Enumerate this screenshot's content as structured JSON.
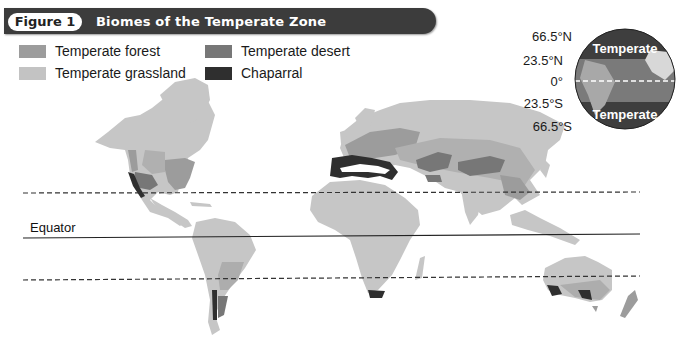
{
  "figure": {
    "number_label": "Figure 1",
    "title": "Biomes of the Temperate Zone"
  },
  "legend": [
    {
      "label": "Temperate forest",
      "color": "#9c9c9c"
    },
    {
      "label": "Temperate desert",
      "color": "#777777"
    },
    {
      "label": "Temperate grassland",
      "color": "#c3c3c3"
    },
    {
      "label": "Chaparral",
      "color": "#2f2f2f"
    }
  ],
  "globe_inset": {
    "latitude_labels": [
      "66.5°N",
      "23.5°N",
      "0°",
      "23.5°S",
      "66.5°S"
    ],
    "north_band_label": "Temperate",
    "south_band_label": "Temperate"
  },
  "map": {
    "equator_label": "Equator",
    "lines": [
      {
        "name": "tropic-of-cancer",
        "latitude": "23.5°N",
        "style": "dashed"
      },
      {
        "name": "equator",
        "latitude": "0°",
        "style": "solid"
      },
      {
        "name": "tropic-of-capricorn",
        "latitude": "23.5°S",
        "style": "dashed"
      }
    ],
    "land_color": "#c6c6c6"
  }
}
